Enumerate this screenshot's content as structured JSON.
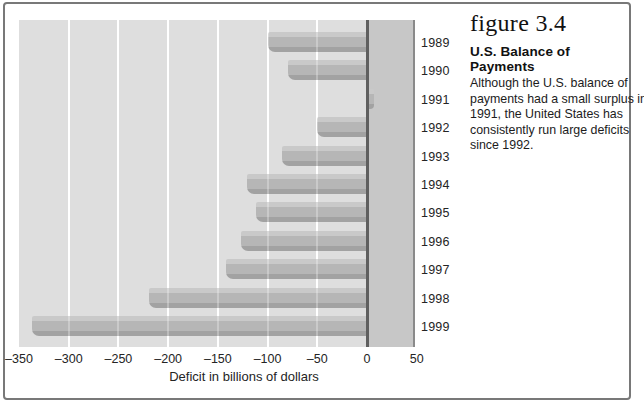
{
  "figure": {
    "label": "figure 3.4",
    "heading": "U.S. Balance of Payments",
    "description_lines": [
      "Although the U.S. balance of",
      "payments had a small surplus in",
      "1991, the United States has",
      "consistently run large deficits",
      "since 1992."
    ]
  },
  "chart_data": {
    "type": "bar",
    "orientation": "horizontal",
    "title": "",
    "xlabel": "Deficit in billions of dollars",
    "categories": [
      "1989",
      "1990",
      "1991",
      "1992",
      "1993",
      "1994",
      "1995",
      "1996",
      "1997",
      "1998",
      "1999"
    ],
    "values": [
      -100,
      -79,
      5,
      -50,
      -85,
      -121,
      -112,
      -127,
      -142,
      -219,
      -337
    ],
    "xlim": [
      -350,
      50
    ],
    "xticks": [
      -350,
      -300,
      -250,
      -200,
      -150,
      -100,
      -50,
      0,
      50
    ],
    "xtick_labels": [
      "–350",
      "–300",
      "–250",
      "–200",
      "–150",
      "–100",
      "–50",
      "0",
      "50"
    ],
    "gridline_ticks": [
      -300,
      -250,
      -200,
      -150,
      -100,
      -50
    ],
    "grid": true,
    "legend": false,
    "positive_region_shaded": true,
    "colors": {
      "plot_bg": "#dedede",
      "positive_band": "#c7c7c7",
      "gridline": "#ffffff",
      "gridline_overlay": "rgba(255,255,255,0.28)",
      "zero_line": "#5f5f5f",
      "plot_edge": "#8a8a8a",
      "bar_top": "#c9c9c9",
      "bar_mid": "#b6b6b6",
      "bar_bottom": "#a2a2a2",
      "frame_border": "#787878",
      "text": "#242424"
    }
  }
}
